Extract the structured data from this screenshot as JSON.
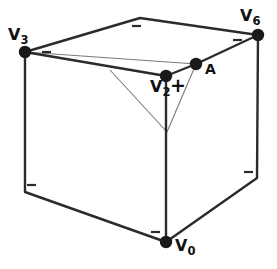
{
  "figure": {
    "width": 277,
    "height": 269,
    "background_color": "#ffffff",
    "line_color": "#2b2b2b",
    "thin_line_color": "#7a7a7a",
    "vertex_color": "#1a1a1a",
    "tick_color": "#2b2b2b"
  },
  "labels": {
    "v3": {
      "text": "V",
      "sub": "3"
    },
    "v6": {
      "text": "V",
      "sub": "6"
    },
    "v2": {
      "text": "V",
      "sub": "2"
    },
    "v0": {
      "text": "V",
      "sub": "0"
    },
    "a": {
      "text": "A"
    },
    "plus": {
      "text": "+"
    }
  },
  "geometry": {
    "cube_outline": [
      {
        "name": "top-apex",
        "x": 140,
        "y": 18
      },
      {
        "name": "v6",
        "x": 258,
        "y": 35
      },
      {
        "name": "bottom-right",
        "x": 257,
        "y": 178
      },
      {
        "name": "v0",
        "x": 166,
        "y": 242
      },
      {
        "name": "bottom-left",
        "x": 25,
        "y": 192
      },
      {
        "name": "v3",
        "x": 25,
        "y": 52
      }
    ],
    "interior_edges": [
      {
        "from": "v3",
        "to": "v2"
      },
      {
        "from": "v2",
        "to": "a"
      },
      {
        "from": "a",
        "to": "v6"
      },
      {
        "from": "v2",
        "to": "v0"
      }
    ],
    "thin_lines": [
      {
        "from": "v3",
        "to": "a"
      },
      {
        "from": "branch-point",
        "to": "apex"
      },
      {
        "from": "a",
        "to": "apex"
      }
    ],
    "vertices": [
      {
        "name": "v3",
        "x": 25,
        "y": 52,
        "r": 6
      },
      {
        "name": "v6",
        "x": 258,
        "y": 35,
        "r": 6
      },
      {
        "name": "v2",
        "x": 166,
        "y": 76,
        "r": 6
      },
      {
        "name": "a",
        "x": 196,
        "y": 64,
        "r": 6
      },
      {
        "name": "v0",
        "x": 166,
        "y": 242,
        "r": 6
      }
    ],
    "tick_marks": [
      {
        "name": "tick-top",
        "x": 136,
        "y": 26
      },
      {
        "name": "tick-upper-left",
        "x": 46,
        "y": 52
      },
      {
        "name": "tick-upper-right",
        "x": 237,
        "y": 40
      },
      {
        "name": "tick-lower-left",
        "x": 31,
        "y": 185
      },
      {
        "name": "tick-lower-right",
        "x": 248,
        "y": 172
      },
      {
        "name": "tick-bottom",
        "x": 155,
        "y": 232
      }
    ],
    "thin_triangle_apex": {
      "x": 167,
      "y": 132
    },
    "thin_branch_point": {
      "x": 110,
      "y": 70
    }
  }
}
